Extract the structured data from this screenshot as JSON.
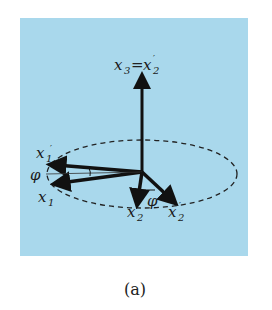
{
  "figure": {
    "caption": "(a)",
    "panel_color": "#a9d8ec",
    "labels": {
      "x3": "x",
      "x3_sub": "3",
      "equals": "=",
      "x2p_top": "x",
      "x2p_top_sub": "2",
      "x1_upper": "x",
      "x1_upper_sub": "1",
      "x1_lower": "x",
      "x1_lower_sub": "1",
      "x2": "x",
      "x2_sub": "2",
      "x2p": "x",
      "x2p_sub": "2",
      "phi_left": "φ",
      "phi_bottom": "φ"
    }
  }
}
